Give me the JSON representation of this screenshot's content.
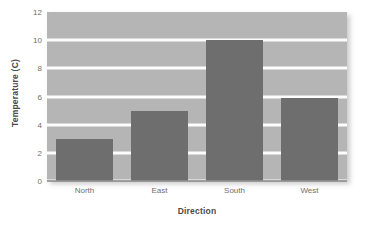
{
  "chart_data": {
    "type": "bar",
    "title": "",
    "xlabel": "Direction",
    "ylabel": "Temperature (C)",
    "categories": [
      "North",
      "East",
      "South",
      "West"
    ],
    "values": [
      3.0,
      5.0,
      10.0,
      5.9
    ],
    "ylim": [
      0,
      12
    ],
    "yticks": [
      0,
      2,
      4,
      6,
      8,
      10,
      12
    ],
    "ytick_labels": [
      "0",
      "2",
      "4",
      "6",
      "8",
      "10",
      "12"
    ],
    "grid": true,
    "grid_axis": "y",
    "grid_color": "#fdfdfd",
    "legend": false,
    "legend_position": "none",
    "bar_color": "#6e6e6e",
    "plot_background": "#b5b5b5",
    "figure_background": "#ffffff",
    "tick_label_color": "#6f6f6f",
    "axis_label_color": "#4a4a4a"
  }
}
